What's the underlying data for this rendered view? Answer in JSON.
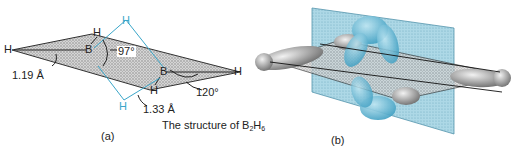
{
  "panel_a": {
    "label": "(a)",
    "caption_prefix": "The structure of B",
    "caption_sub1": "2",
    "caption_mid": "H",
    "caption_sub2": "6",
    "atoms": {
      "h_left": "H",
      "b_left": "B",
      "h_top_terminal": "H",
      "h_bridge_top": "H",
      "b_right": "B",
      "h_right": "H",
      "h_bottom_terminal": "H",
      "h_bridge_bottom": "H"
    },
    "annotations": {
      "angle_hbh_bridge": "97°",
      "angle_terminal": "120°",
      "bond_terminal": "1.19 Å",
      "bond_bridge": "1.33 Å"
    }
  },
  "panel_b": {
    "label": "(b)"
  },
  "colors": {
    "bridge_blue": "#3aa6c9",
    "plane_blue": "#8fc9dc",
    "stipple_gray": "#b8b8b8"
  }
}
